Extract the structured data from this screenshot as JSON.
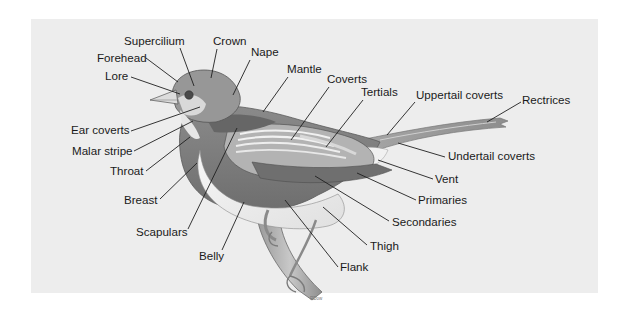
{
  "diagram": {
    "colors": {
      "page_background": "#ffffff",
      "panel_background": "#ededed",
      "label_text": "#1a1a1a",
      "leader_line": "#1f1f1f"
    },
    "labels": [
      {
        "id": "supercilium",
        "text": "Supercilium",
        "x": 124,
        "y": 45,
        "anchor": "start",
        "line": [
          180,
          48,
          194,
          86
        ]
      },
      {
        "id": "crown",
        "text": "Crown",
        "x": 213,
        "y": 45,
        "anchor": "start",
        "line": [
          217,
          49,
          211,
          78
        ]
      },
      {
        "id": "forehead",
        "text": "Forehead",
        "x": 97,
        "y": 62,
        "anchor": "start",
        "line": [
          146,
          58,
          178,
          82
        ]
      },
      {
        "id": "nape",
        "text": "Nape",
        "x": 251,
        "y": 56,
        "anchor": "start",
        "line": [
          250,
          60,
          233,
          95
        ]
      },
      {
        "id": "lore",
        "text": "Lore",
        "x": 105,
        "y": 80,
        "anchor": "start",
        "line": [
          131,
          77,
          180,
          94
        ]
      },
      {
        "id": "mantle",
        "text": "Mantle",
        "x": 287,
        "y": 73,
        "anchor": "start",
        "line": [
          288,
          77,
          263,
          112
        ]
      },
      {
        "id": "coverts",
        "text": "Coverts",
        "x": 327,
        "y": 83,
        "anchor": "start",
        "line": [
          329,
          87,
          291,
          140
        ]
      },
      {
        "id": "tertials",
        "text": "Tertials",
        "x": 361,
        "y": 96,
        "anchor": "start",
        "line": [
          363,
          100,
          326,
          147
        ]
      },
      {
        "id": "uppertail-coverts",
        "text": "Uppertail coverts",
        "x": 416,
        "y": 99,
        "anchor": "start",
        "line": [
          415,
          102,
          387,
          135
        ]
      },
      {
        "id": "rectrices",
        "text": "Rectrices",
        "x": 522,
        "y": 104,
        "anchor": "start",
        "line": [
          521,
          102,
          487,
          122
        ]
      },
      {
        "id": "ear-coverts",
        "text": "Ear coverts",
        "x": 71,
        "y": 134,
        "anchor": "start",
        "line": [
          131,
          131,
          200,
          107
        ]
      },
      {
        "id": "undertail-coverts",
        "text": "Undertail coverts",
        "x": 448,
        "y": 160,
        "anchor": "start",
        "line": [
          445,
          157,
          398,
          143
        ]
      },
      {
        "id": "malar-stripe",
        "text": "Malar stripe",
        "x": 72,
        "y": 155,
        "anchor": "start",
        "line": [
          134,
          151,
          193,
          121
        ]
      },
      {
        "id": "throat",
        "text": "Throat",
        "x": 110,
        "y": 175,
        "anchor": "start",
        "line": [
          146,
          171,
          190,
          137
        ]
      },
      {
        "id": "vent",
        "text": "Vent",
        "x": 435,
        "y": 183,
        "anchor": "start",
        "line": [
          433,
          179,
          378,
          160
        ]
      },
      {
        "id": "primaries",
        "text": "Primaries",
        "x": 418,
        "y": 204,
        "anchor": "start",
        "line": [
          416,
          200,
          357,
          173
        ]
      },
      {
        "id": "breast",
        "text": "Breast",
        "x": 124,
        "y": 204,
        "anchor": "start",
        "line": [
          160,
          199,
          197,
          163
        ]
      },
      {
        "id": "secondaries",
        "text": "Secondaries",
        "x": 392,
        "y": 226,
        "anchor": "start",
        "line": [
          389,
          221,
          315,
          176
        ]
      },
      {
        "id": "scapulars",
        "text": "Scapulars",
        "x": 136,
        "y": 236,
        "anchor": "start",
        "line": [
          188,
          229,
          237,
          128
        ]
      },
      {
        "id": "thigh",
        "text": "Thigh",
        "x": 370,
        "y": 250,
        "anchor": "start",
        "line": [
          367,
          245,
          323,
          207
        ]
      },
      {
        "id": "belly",
        "text": "Belly",
        "x": 199,
        "y": 260,
        "anchor": "start",
        "line": [
          222,
          250,
          244,
          202
        ]
      },
      {
        "id": "flank",
        "text": "Flank",
        "x": 340,
        "y": 271,
        "anchor": "start",
        "line": [
          338,
          267,
          285,
          200
        ]
      }
    ],
    "artist_signature": "RDow"
  }
}
